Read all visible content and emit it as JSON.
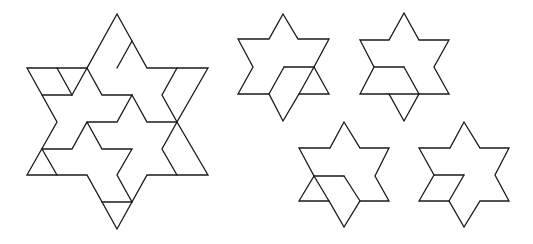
{
  "figure": {
    "width": 533,
    "height": 244,
    "stroke_color": "#1a1a1a",
    "background": "#ffffff",
    "stars": [
      {
        "name": "large-dissected-hexagram",
        "outline": "117,14 132,41 147,68 208,68 177,122 208,175 147,175 117,229 87,175 27,175 57,122 27,68 87,68",
        "inner_lines": [
          "132,41 117,68",
          "57,68 72,95 87,68",
          "42,95 72,95",
          "87,68 102,95 132,95 117,122 87,122 72,149 42,149",
          "132,95 147,122 177,122",
          "177,68 162,95 177,122 162,149 177,175",
          "87,122 102,149 132,149 117,175 132,202",
          "42,149 57,175",
          "102,202 132,202"
        ]
      },
      {
        "name": "small-hexagram-1",
        "outline": "283,14 298,39 329,39 314,67 329,94 299,94 283,121 269,94 238,94 253,67 238,39 269,39",
        "inner_lines": [
          "284,67 314,67",
          "284,67 269,94",
          "314,67 299,94"
        ]
      },
      {
        "name": "small-hexagram-2",
        "outline": "404,13 419,40 449,40 434,67 449,94 419,94 404,121 389,94 360,94 374,67 360,40 389,40",
        "inner_lines": [
          "374,67 404,67",
          "404,67 419,94",
          "389,94 419,94"
        ]
      },
      {
        "name": "small-hexagram-3",
        "outline": "344,122 360,148 389,148 375,176 389,201 360,201 344,227 329,201 299,201 314,176 299,148 330,148",
        "inner_lines": [
          "314,176 344,176",
          "344,176 360,201",
          "314,176 329,201"
        ]
      },
      {
        "name": "small-hexagram-4",
        "outline": "464,122 480,148 509,148 495,175 509,201 480,201 464,227 449,201 419,201 434,175 419,148 450,148",
        "inner_lines": [
          "434,175 464,175",
          "464,175 449,201"
        ]
      }
    ]
  }
}
